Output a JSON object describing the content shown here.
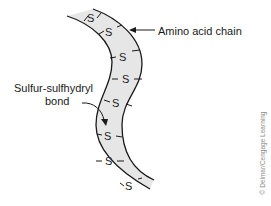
{
  "figure": {
    "labels": {
      "chain": "Amino acid chain",
      "bond_line1": "Sulfur-sulfhydryl",
      "bond_line2": "bond"
    },
    "bond_symbol": "S",
    "bond_count": 8,
    "credit": "© Delmar/Cengage Learning",
    "colors": {
      "band_fill": "#e6e6e6",
      "outline": "#1a1a1a",
      "text": "#1a1a1a",
      "credit": "#8a8a8a"
    }
  }
}
